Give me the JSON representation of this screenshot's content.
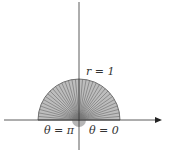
{
  "diagram": {
    "labels": {
      "radius": "r = 1",
      "theta_pi": "θ = π",
      "theta_zero": "θ = 0"
    },
    "region": {
      "r_max": 1,
      "theta_min": "0",
      "theta_max": "π",
      "spoke_count": 36
    },
    "colors": {
      "fill": "#b8b8b8",
      "spoke": "#666666",
      "axis": "#333333",
      "text": "#333333"
    }
  }
}
